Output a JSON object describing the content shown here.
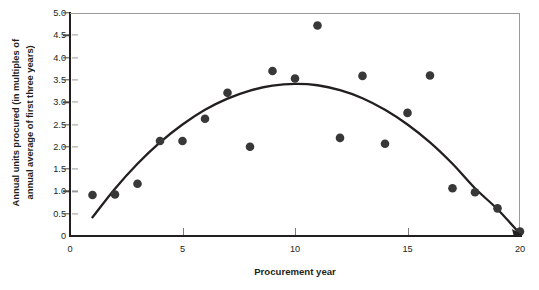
{
  "chart_data": {
    "type": "scatter",
    "title": "",
    "xlabel": "Procurement year",
    "ylabel": "Annual units procured (in multiples of\nannual average of first three years)",
    "xlim": [
      0,
      20
    ],
    "ylim": [
      0,
      5
    ],
    "grid": false,
    "legend": "none",
    "xticks": [
      0,
      5,
      10,
      15,
      20
    ],
    "xtick_labels": [
      "0",
      "5",
      "10",
      "15",
      "20"
    ],
    "yticks": [
      0,
      0.5,
      1.0,
      1.5,
      2.0,
      2.5,
      3.0,
      3.5,
      4.0,
      4.5,
      5.0
    ],
    "ytick_labels": [
      "0",
      "0.5",
      "1.0",
      "1.5",
      "2.0",
      "2.5",
      "3.0",
      "3.5",
      "4.0",
      "4.5",
      "5.0"
    ],
    "series": [
      {
        "name": "Annual units procured",
        "kind": "scatter",
        "marker": "filled-circle",
        "color": "#383838",
        "x": [
          1,
          2,
          3,
          4,
          5,
          6,
          7,
          8,
          9,
          10,
          11,
          12,
          13,
          14,
          15,
          16,
          17,
          18,
          19,
          20
        ],
        "y": [
          0.92,
          0.93,
          1.17,
          2.13,
          2.13,
          2.63,
          3.21,
          2.0,
          3.7,
          3.53,
          4.72,
          2.2,
          3.59,
          2.07,
          2.76,
          3.6,
          1.07,
          0.98,
          0.62,
          0.1
        ]
      },
      {
        "name": "Fitted quadratic trend",
        "kind": "line",
        "color": "#231f20",
        "x": [
          1,
          2,
          3,
          4,
          5,
          6,
          7,
          8,
          9,
          10,
          11,
          12,
          13,
          14,
          15,
          16,
          17,
          18,
          19,
          20
        ],
        "y": [
          0.42,
          1.06,
          1.62,
          2.1,
          2.5,
          2.83,
          3.08,
          3.26,
          3.37,
          3.41,
          3.38,
          3.27,
          3.09,
          2.83,
          2.5,
          2.1,
          1.62,
          1.07,
          0.6,
          0.05
        ]
      }
    ],
    "annotations": [
      {
        "text": "peak of fitted curve near year 10",
        "x": 10.2,
        "y": 3.42
      },
      {
        "text": "outlier high point at year 11",
        "x": 11,
        "y": 4.72
      }
    ]
  },
  "axis": {
    "x_title": "Procurement year",
    "y_title": "Annual units procured (in multiples of\nannual average of first three years)"
  }
}
